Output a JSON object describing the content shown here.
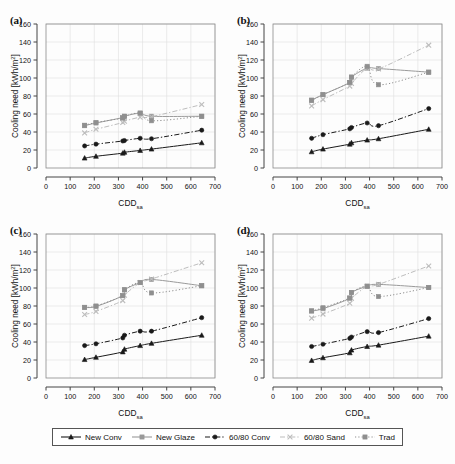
{
  "figure": {
    "title": "",
    "panel_labels": [
      "(a)",
      "(b)",
      "(c)",
      "(d)"
    ],
    "axis": {
      "xlabel_main": "CDD",
      "xlabel_sub": "sa",
      "ylabel": "Cooling need [kWh/m",
      "ylabel_sup": "2",
      "ylabel_tail": "]",
      "xticks": [
        0,
        100,
        200,
        300,
        400,
        500,
        600,
        700
      ],
      "yticks": [
        0,
        20,
        40,
        60,
        80,
        100,
        120,
        140,
        160
      ],
      "xlim": [
        0,
        700
      ],
      "ylim": [
        0,
        160
      ]
    },
    "colors": {
      "new_conv": "#1a1a1a",
      "new_glaze": "#9a9a9a",
      "c6080_conv": "#1a1a1a",
      "c6080_sand": "#bdbdbd",
      "trad": "#8f8f8f",
      "grid": "#e2e2e2",
      "axis": "#444444",
      "text": "#111111",
      "background": "#fdfdfd"
    }
  },
  "legend": {
    "position": "bottom-center",
    "items": [
      {
        "label": "New Conv",
        "key": "new_conv",
        "color": "#1a1a1a",
        "dash": "solid",
        "marker": "triangle"
      },
      {
        "label": "New Glaze",
        "key": "new_glaze",
        "color": "#9a9a9a",
        "dash": "solid",
        "marker": "square"
      },
      {
        "label": "60/80 Conv",
        "key": "c6080_conv",
        "color": "#1a1a1a",
        "dash": "dashdot",
        "marker": "circle"
      },
      {
        "label": "60/80 Sand",
        "key": "c6080_sand",
        "color": "#bdbdbd",
        "dash": "dashdot",
        "marker": "cross"
      },
      {
        "label": "Trad",
        "key": "trad",
        "color": "#8f8f8f",
        "dash": "dotted",
        "marker": "square"
      }
    ]
  },
  "chart_data": [
    {
      "panel": "(a)",
      "type": "scatter",
      "title": "",
      "xlabel": "CDDsa",
      "ylabel": "Cooling need [kWh/m2]",
      "xlim": [
        0,
        700
      ],
      "ylim": [
        0,
        160
      ],
      "grid": true,
      "series": [
        {
          "name": "New Conv",
          "x": [
            160,
            207,
            318,
            325,
            390,
            437,
            645
          ],
          "y": [
            11,
            13,
            16.5,
            17.5,
            19.5,
            21,
            28
          ]
        },
        {
          "name": "New Glaze",
          "x": [
            160,
            207,
            318,
            325,
            390,
            437,
            645
          ],
          "y": [
            47,
            50,
            56,
            57.5,
            61,
            57.5,
            57.5
          ]
        },
        {
          "name": "60/80 Conv",
          "x": [
            160,
            207,
            318,
            325,
            390,
            437,
            645
          ],
          "y": [
            24.5,
            26.5,
            30,
            30.5,
            33,
            32.5,
            42
          ]
        },
        {
          "name": "60/80 Sand",
          "x": [
            160,
            207,
            318,
            325,
            390,
            437,
            645
          ],
          "y": [
            39,
            43,
            50.5,
            52,
            56.5,
            57,
            70.5
          ]
        },
        {
          "name": "Trad",
          "x": [
            160,
            207,
            318,
            325,
            390,
            437,
            645
          ],
          "y": [
            47.5,
            50.5,
            55.5,
            57.5,
            61,
            52.5,
            57.5
          ]
        }
      ]
    },
    {
      "panel": "(b)",
      "type": "scatter",
      "title": "",
      "xlabel": "CDDsa",
      "ylabel": "Cooling need [kWh/m2]",
      "xlim": [
        0,
        700
      ],
      "ylim": [
        0,
        160
      ],
      "grid": true,
      "series": [
        {
          "name": "New Conv",
          "x": [
            160,
            207,
            318,
            325,
            390,
            437,
            645
          ],
          "y": [
            18,
            21,
            26.5,
            28,
            31,
            32.5,
            43
          ]
        },
        {
          "name": "New Glaze",
          "x": [
            160,
            207,
            318,
            325,
            390,
            437,
            645
          ],
          "y": [
            75.5,
            81.5,
            95,
            101,
            111,
            110.5,
            106.5
          ]
        },
        {
          "name": "60/80 Conv",
          "x": [
            160,
            207,
            318,
            325,
            390,
            437,
            645
          ],
          "y": [
            33,
            37,
            43.5,
            45,
            50,
            47,
            66
          ]
        },
        {
          "name": "60/80 Sand",
          "x": [
            160,
            207,
            318,
            325,
            390,
            437,
            645
          ],
          "y": [
            69,
            76,
            91,
            94,
            111,
            110,
            136.5
          ]
        },
        {
          "name": "Trad",
          "x": [
            160,
            207,
            318,
            325,
            390,
            437,
            645
          ],
          "y": [
            75,
            81.5,
            95,
            101,
            113,
            92.5,
            106.5
          ]
        }
      ]
    },
    {
      "panel": "(c)",
      "type": "scatter",
      "title": "",
      "xlabel": "CDDsa",
      "ylabel": "Cooling need [kWh/m2]",
      "xlim": [
        0,
        700
      ],
      "ylim": [
        0,
        160
      ],
      "grid": true,
      "series": [
        {
          "name": "New Conv",
          "x": [
            160,
            207,
            318,
            325,
            390,
            437,
            645
          ],
          "y": [
            20.5,
            23,
            29,
            32,
            36,
            38.5,
            47.5
          ]
        },
        {
          "name": "New Glaze",
          "x": [
            160,
            207,
            318,
            325,
            390,
            437,
            645
          ],
          "y": [
            78.5,
            79.5,
            91.5,
            98,
            106,
            109.5,
            102.5
          ]
        },
        {
          "name": "60/80 Conv",
          "x": [
            160,
            207,
            318,
            325,
            390,
            437,
            645
          ],
          "y": [
            36,
            38,
            44.5,
            47.5,
            52,
            52,
            67
          ]
        },
        {
          "name": "60/80 Sand",
          "x": [
            160,
            207,
            318,
            325,
            390,
            437,
            645
          ],
          "y": [
            70.5,
            74,
            86,
            92,
            106,
            110,
            128
          ]
        },
        {
          "name": "Trad",
          "x": [
            160,
            207,
            318,
            325,
            390,
            437,
            645
          ],
          "y": [
            78.5,
            80,
            91.5,
            98,
            106,
            94.5,
            102.5
          ]
        }
      ]
    },
    {
      "panel": "(d)",
      "type": "scatter",
      "title": "",
      "xlabel": "CDDsa",
      "ylabel": "Cooling need [kWh/m2]",
      "xlim": [
        0,
        700
      ],
      "ylim": [
        0,
        160
      ],
      "grid": true,
      "series": [
        {
          "name": "New Conv",
          "x": [
            160,
            207,
            318,
            325,
            390,
            437,
            645
          ],
          "y": [
            19.5,
            22.5,
            28,
            31,
            35,
            36.5,
            46.5
          ]
        },
        {
          "name": "New Glaze",
          "x": [
            160,
            207,
            318,
            325,
            390,
            437,
            645
          ],
          "y": [
            74.5,
            77,
            88.5,
            95,
            102,
            104,
            100.5
          ]
        },
        {
          "name": "60/80 Conv",
          "x": [
            160,
            207,
            318,
            325,
            390,
            437,
            645
          ],
          "y": [
            35,
            37.5,
            44,
            45.5,
            51.5,
            50.5,
            66
          ]
        },
        {
          "name": "60/80 Sand",
          "x": [
            160,
            207,
            318,
            325,
            390,
            437,
            645
          ],
          "y": [
            66.5,
            71,
            83,
            88.5,
            102,
            104,
            124.5
          ]
        },
        {
          "name": "Trad",
          "x": [
            160,
            207,
            318,
            325,
            390,
            437,
            645
          ],
          "y": [
            74.5,
            78,
            89,
            95,
            102,
            90.5,
            100.5
          ]
        }
      ]
    }
  ]
}
